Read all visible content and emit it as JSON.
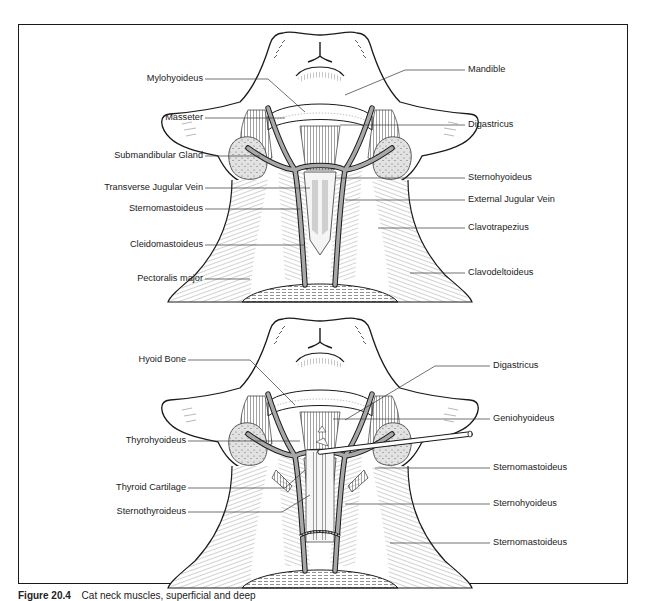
{
  "figure": {
    "caption_number": "Figure 20.4",
    "caption_text": "Cat neck muscles, superficial and deep"
  },
  "panels": [
    {
      "name": "superficial",
      "left_labels": [
        {
          "text": "Mylohyoideus",
          "y": 79
        },
        {
          "text": "Masseter",
          "y": 118
        },
        {
          "text": "Submandibular Gland",
          "y": 156
        },
        {
          "text": "Transverse Jugular Vein",
          "y": 188
        },
        {
          "text": "Sternomastoideus",
          "y": 209
        },
        {
          "text": "Cleidomastoideus",
          "y": 245
        },
        {
          "text": "Pectoralis major",
          "y": 279
        }
      ],
      "right_labels": [
        {
          "text": "Mandible",
          "y": 70
        },
        {
          "text": "Digastricus",
          "y": 125
        },
        {
          "text": "Sternohyoideus",
          "y": 178
        },
        {
          "text": "External Jugular Vein",
          "y": 200
        },
        {
          "text": "Clavotrapezius",
          "y": 228
        },
        {
          "text": "Clavodeltoideus",
          "y": 273
        }
      ]
    },
    {
      "name": "deep",
      "left_labels": [
        {
          "text": "Hyoid Bone",
          "y": 360
        },
        {
          "text": "Thyrohyoideus",
          "y": 441
        },
        {
          "text": "Thyroid Cartilage",
          "y": 488
        },
        {
          "text": "Sternothyroideus",
          "y": 512
        }
      ],
      "right_labels": [
        {
          "text": "Digastricus",
          "y": 366
        },
        {
          "text": "Geniohyoideus",
          "y": 419
        },
        {
          "text": "Sternomastoideus",
          "y": 468
        },
        {
          "text": "Sternohyoideus",
          "y": 504
        },
        {
          "text": "Sternomastoideus",
          "y": 543
        }
      ]
    }
  ],
  "labels": {
    "top_left": [
      "Mylohyoideus",
      "Masseter",
      "Submandibular Gland",
      "Transverse Jugular Vein",
      "Sternomastoideus",
      "Cleidomastoideus",
      "Pectoralis major"
    ],
    "top_right": [
      "Mandible",
      "Digastricus",
      "Sternohyoideus",
      "External Jugular Vein",
      "Clavotrapezius",
      "Clavodeltoideus"
    ],
    "bottom_left": [
      "Hyoid Bone",
      "Thyrohyoideus",
      "Thyroid Cartilage",
      "Sternothyroideus"
    ],
    "bottom_right": [
      "Digastricus",
      "Geniohyoideus",
      "Sternomastoideus",
      "Sternohyoideus",
      "Sternomastoideus"
    ]
  },
  "colors": {
    "line": "#1a1a1a",
    "vein": "#9a9a9a",
    "gland": "#d8d8d8",
    "background": "#ffffff"
  }
}
